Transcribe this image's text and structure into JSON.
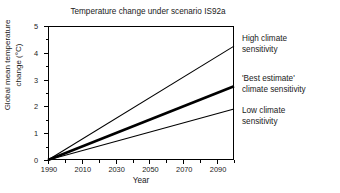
{
  "chart_data": {
    "type": "line",
    "title": "Temperature change under scenario IS92a",
    "xlabel": "Year",
    "ylabel_line1": "Global mean temperature",
    "ylabel_line2": "change (°C)",
    "ylabel": "Global mean temperature change (°C)",
    "xlim": [
      1990,
      2100
    ],
    "ylim": [
      0,
      5
    ],
    "grid": false,
    "legend_position": "right-inline-annotations",
    "x_major_ticks": [
      1990,
      2010,
      2030,
      2050,
      2070,
      2090
    ],
    "x_major_tick_labels": [
      "1990",
      "2010",
      "2030",
      "2050",
      "2070",
      "2090"
    ],
    "x_minor_ticks": [
      2000,
      2020,
      2040,
      2060,
      2080,
      2100
    ],
    "y_major_ticks": [
      0,
      1,
      2,
      3,
      4,
      5
    ],
    "y_major_tick_labels": [
      "0",
      "1",
      "2",
      "3",
      "4",
      "5"
    ],
    "y_minor_ticks": [
      0.5,
      1.5,
      2.5,
      3.5,
      4.5
    ],
    "x": [
      1990,
      2100
    ],
    "series": [
      {
        "name": "High climate sensitivity",
        "values": [
          0,
          4.25
        ],
        "color": "#000000",
        "line_width": 1.1,
        "annotation_line1": "High climate",
        "annotation_line2": "sensitivity"
      },
      {
        "name": "'Best estimate' climate sensitivity",
        "values": [
          0,
          2.75
        ],
        "color": "#000000",
        "line_width": 2.6,
        "annotation_line1": "'Best estimate'",
        "annotation_line2": "climate sensitivity"
      },
      {
        "name": "Low climate sensitivity",
        "values": [
          0,
          1.9
        ],
        "color": "#000000",
        "line_width": 1.1,
        "annotation_line1": "Low climate",
        "annotation_line2": "sensitivity"
      }
    ]
  }
}
